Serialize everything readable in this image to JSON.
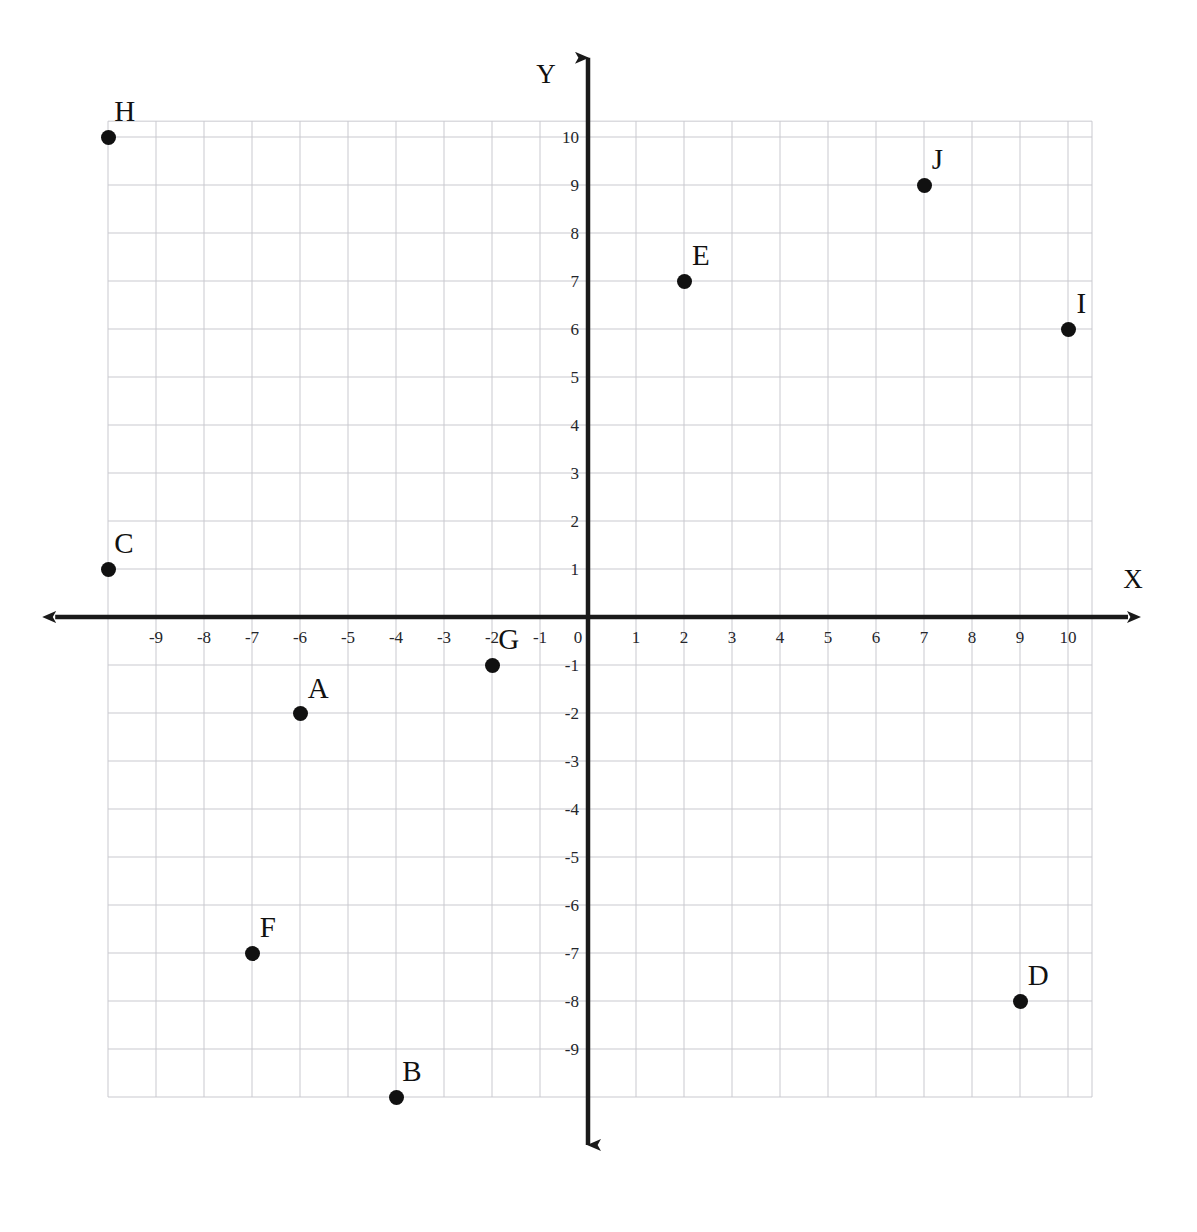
{
  "chart_data": {
    "type": "scatter",
    "title": "",
    "xlabel": "X",
    "ylabel": "Y",
    "xlim": [
      -10,
      10.5
    ],
    "ylim": [
      -10,
      10.33
    ],
    "grid": true,
    "grid_spacing": 1,
    "legend": "none",
    "xticks": [
      -9,
      -8,
      -7,
      -6,
      -5,
      -4,
      -3,
      -2,
      -1,
      0,
      1,
      2,
      3,
      4,
      5,
      6,
      7,
      8,
      9,
      10
    ],
    "xtick_labels": [
      "-9",
      "-8",
      "-7",
      "-6",
      "-5",
      "-4",
      "-3",
      "-2",
      "-1",
      "0",
      "1",
      "2",
      "3",
      "4",
      "5",
      "6",
      "7",
      "8",
      "9",
      "10"
    ],
    "yticks": [
      10,
      9,
      8,
      7,
      6,
      5,
      4,
      3,
      2,
      1,
      -1,
      -2,
      -3,
      -4,
      -5,
      -6,
      -7,
      -8,
      -9
    ],
    "ytick_labels": [
      "10",
      "9",
      "8",
      "7",
      "6",
      "5",
      "4",
      "3",
      "2",
      "1",
      "-1",
      "-2",
      "-3",
      "-4",
      "-5",
      "-6",
      "-7",
      "-8",
      "-9"
    ],
    "points": [
      {
        "label": "A",
        "x": -6,
        "y": -2,
        "label_dx": 0.38,
        "label_dy": 0.52
      },
      {
        "label": "B",
        "x": -4,
        "y": -10,
        "label_dx": 0.33,
        "label_dy": 0.55
      },
      {
        "label": "C",
        "x": -10,
        "y": 1,
        "label_dx": 0.33,
        "label_dy": 0.55
      },
      {
        "label": "D",
        "x": 9,
        "y": -8,
        "label_dx": 0.38,
        "label_dy": 0.55
      },
      {
        "label": "E",
        "x": 2,
        "y": 7,
        "label_dx": 0.35,
        "label_dy": 0.55
      },
      {
        "label": "F",
        "x": -7,
        "y": -7,
        "label_dx": 0.33,
        "label_dy": 0.55
      },
      {
        "label": "G",
        "x": -2,
        "y": -1,
        "label_dx": 0.35,
        "label_dy": 0.55
      },
      {
        "label": "H",
        "x": -10,
        "y": 10,
        "label_dx": 0.35,
        "label_dy": 0.55
      },
      {
        "label": "I",
        "x": 10,
        "y": 6,
        "label_dx": 0.28,
        "label_dy": 0.55
      },
      {
        "label": "J",
        "x": 7,
        "y": 9,
        "label_dx": 0.28,
        "label_dy": 0.55
      }
    ]
  },
  "geometry": {
    "origin_x": 588,
    "origin_y": 617,
    "unit": 48,
    "grid_left": -10,
    "grid_right": 10.5,
    "grid_top": 10.33,
    "grid_bottom": -10,
    "axis_x_start": -11.1,
    "axis_x_end": 11.25,
    "axis_y_top": 11.65,
    "axis_y_bottom": -11.0
  },
  "colors": {
    "grid_line": "#c9c9cf",
    "axis_line": "#1a1a1a",
    "point_fill": "#111111",
    "tick_text": "#25262b",
    "background": "#ffffff"
  }
}
